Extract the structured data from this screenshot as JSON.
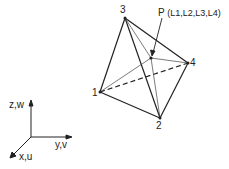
{
  "figure": {
    "vertices": [
      {
        "id": "1",
        "label": "1",
        "x": 100,
        "y": 92
      },
      {
        "id": "2",
        "label": "2",
        "x": 160,
        "y": 118
      },
      {
        "id": "3",
        "label": "3",
        "x": 125,
        "y": 18
      },
      {
        "id": "4",
        "label": "4",
        "x": 188,
        "y": 63
      }
    ],
    "point": {
      "label": "P",
      "coords": "(L1,L2,L3,L4)",
      "x": 151,
      "y": 58
    },
    "axes": {
      "vertical": "z,w",
      "horizontal": "y,v",
      "depth": "x,u"
    }
  }
}
